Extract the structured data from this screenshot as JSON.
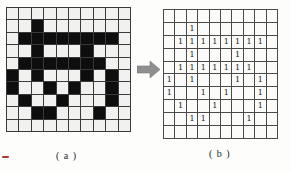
{
  "figure": {
    "matrix": [
      [
        0,
        0,
        0,
        0,
        0,
        0,
        0,
        0,
        0,
        0
      ],
      [
        0,
        0,
        1,
        0,
        0,
        0,
        0,
        0,
        0,
        0
      ],
      [
        0,
        1,
        1,
        1,
        1,
        1,
        1,
        1,
        1,
        0
      ],
      [
        0,
        0,
        1,
        0,
        0,
        0,
        1,
        0,
        0,
        0
      ],
      [
        0,
        1,
        1,
        1,
        1,
        1,
        1,
        1,
        0,
        0
      ],
      [
        1,
        0,
        1,
        0,
        0,
        0,
        1,
        0,
        1,
        0
      ],
      [
        1,
        0,
        0,
        1,
        0,
        1,
        0,
        0,
        1,
        0
      ],
      [
        0,
        1,
        0,
        0,
        1,
        0,
        0,
        0,
        1,
        0
      ],
      [
        0,
        0,
        1,
        1,
        0,
        0,
        0,
        1,
        0,
        0
      ],
      [
        0,
        0,
        0,
        0,
        0,
        0,
        0,
        0,
        0,
        0
      ]
    ],
    "value_char": "1",
    "panel_a": {
      "label": "( a )"
    },
    "panel_b": {
      "label": "( b )"
    },
    "arrow_icon": "right-arrow-icon",
    "colors": {
      "pixel_on": "#0e0e0e",
      "pixel_off": "#f1f1ef",
      "grid_line": "#3a3a3a",
      "digit": "#222222",
      "arrow": "#8f8f8f",
      "red_mark": "#b03a2e"
    }
  }
}
